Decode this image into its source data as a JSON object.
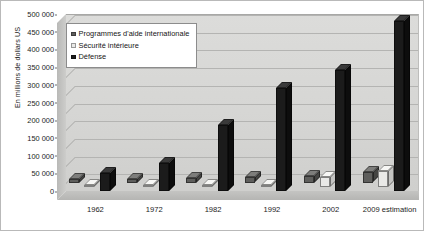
{
  "chart_data": {
    "type": "bar",
    "title": "",
    "subtitle": "",
    "xlabel": "",
    "ylabel": "En millions de dollars US",
    "categories": [
      "1962",
      "1972",
      "1982",
      "1992",
      "2002",
      "2009 estimation"
    ],
    "series": [
      {
        "name": "Programmes d'aide internationale",
        "color": "#5e5e5c",
        "values": [
          11000,
          11000,
          13000,
          15000,
          20000,
          29000
        ]
      },
      {
        "name": "Sécurité intérieure",
        "color": "#e9e9e7",
        "values": [
          2000,
          2500,
          3500,
          6000,
          28000,
          45000
        ]
      },
      {
        "name": "Défense",
        "color": "#1b1b1b",
        "values": [
          52000,
          78000,
          186000,
          291000,
          341000,
          479000
        ]
      }
    ],
    "ylim": [
      0,
      500000
    ],
    "ytick_step": 50000,
    "yticks": [
      "500 000",
      "450 000",
      "400 000",
      "350 000",
      "300 000",
      "250 000",
      "200 000",
      "150 000",
      "100 000",
      "50 000",
      "0"
    ],
    "grid": true,
    "legend_position": "top-left",
    "three_d": true
  },
  "legend": {
    "items": [
      {
        "label": "Programmes d'aide internationale",
        "swatch": "#5e5e5c"
      },
      {
        "label": "Sécurité intérieure",
        "swatch": "#e9e9e7"
      },
      {
        "label": "Défense",
        "swatch": "#1b1b1b"
      }
    ]
  },
  "axes": {
    "y_title": "En millions de dollars US"
  }
}
